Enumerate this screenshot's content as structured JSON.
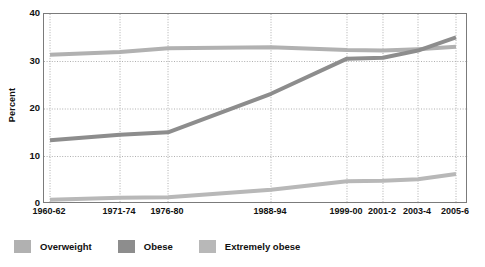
{
  "chart_data": {
    "type": "line",
    "title": "",
    "xlabel": "",
    "ylabel": "Percent",
    "categories": [
      "1960-62",
      "1971-74",
      "1976-80",
      "1988-94",
      "1999-00",
      "2001-2",
      "2003-4",
      "2005-6"
    ],
    "category_positions": [
      0.0142,
      0.1793,
      0.2925,
      0.5354,
      0.7146,
      0.7995,
      0.8821,
      0.9717
    ],
    "ylim": [
      0,
      40
    ],
    "yticks": [
      0,
      10,
      20,
      30,
      40
    ],
    "grid": "dotted-both",
    "legend_position": "below",
    "series": [
      {
        "name": "Overweight",
        "color": "#b1b1b1",
        "values": [
          31.4,
          32.0,
          32.8,
          33.0,
          32.4,
          32.3,
          32.6,
          33.1
        ]
      },
      {
        "name": "Obese",
        "color": "#8d8d8d",
        "values": [
          13.4,
          14.6,
          15.1,
          23.2,
          30.6,
          30.8,
          32.3,
          35.1
        ]
      },
      {
        "name": "Extremely obese",
        "color": "#b8b8b8",
        "values": [
          0.9,
          1.3,
          1.4,
          3.0,
          4.8,
          4.9,
          5.2,
          6.3
        ]
      }
    ]
  },
  "axis": {
    "y_title": "Percent",
    "y_tick_labels": [
      "40",
      "30",
      "20",
      "10",
      "0"
    ],
    "x_tick_labels": [
      "1960-62",
      "1971-74",
      "1976-80",
      "1988-94",
      "1999-00",
      "2001-2",
      "2003-4",
      "2005-6"
    ]
  },
  "legend": {
    "items": [
      {
        "label": "Overweight",
        "color": "#b1b1b1"
      },
      {
        "label": "Obese",
        "color": "#8d8d8d"
      },
      {
        "label": "Extremely obese",
        "color": "#b8b8b8"
      }
    ]
  },
  "style": {
    "grid_color": "#9a9a9a",
    "frame_color": "#7b7b7b",
    "background": "#ffffff",
    "line_width": 4
  }
}
